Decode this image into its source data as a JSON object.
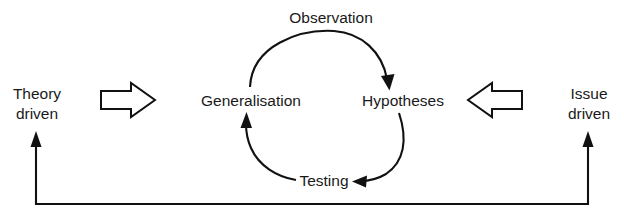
{
  "diagram": {
    "background_color": "#ffffff",
    "line_color": "#111111",
    "text_color": "#1a1a1a",
    "cycle_nodes": [
      {
        "id": "generalisation",
        "label": "Generalisation"
      },
      {
        "id": "hypotheses",
        "label": "Hypotheses"
      },
      {
        "id": "testing",
        "label": "Testing"
      }
    ],
    "edge_labels": [
      {
        "id": "observation",
        "label": "Observation"
      }
    ],
    "side_entries": [
      {
        "id": "theory-driven",
        "line1": "Theory",
        "line2": "driven",
        "arrow_direction": "right"
      },
      {
        "id": "issue-driven",
        "line1": "Issue",
        "line2": "driven",
        "arrow_direction": "left"
      }
    ],
    "feedback": {
      "id": "feedback-bracket",
      "shape": "u-bracket",
      "arrow_direction": "up-both-ends"
    }
  }
}
